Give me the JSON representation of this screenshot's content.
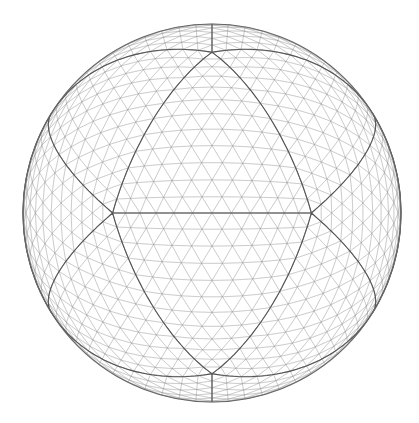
{
  "figure": {
    "width": 419,
    "height": 423,
    "background": "#ffffff",
    "sphere": {
      "center_x": 212,
      "center_y": 213,
      "radius": 189,
      "subdivision_frequency": 12,
      "mesh_color": "#8a8a8a",
      "mesh_width": 0.45,
      "mesh_opacity": 0.75,
      "icosa_edge_color": "#555555",
      "icosa_edge_width": 1.1,
      "outline_color": "#666666",
      "outline_width": 1.2
    },
    "key_vertices": {
      "top": [
        212,
        48
      ],
      "bottom": [
        212,
        378
      ],
      "left": [
        112,
        212
      ],
      "right": [
        311,
        212
      ]
    }
  }
}
